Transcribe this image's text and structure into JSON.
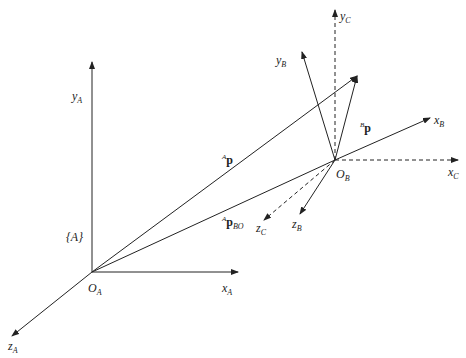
{
  "diagram": {
    "type": "coordinate-frames",
    "frames": {
      "A": {
        "origin": {
          "label": "O",
          "sub": "A"
        },
        "axes": [
          {
            "name": "x",
            "sub": "A"
          },
          {
            "name": "y",
            "sub": "A"
          },
          {
            "name": "z",
            "sub": "A"
          }
        ],
        "frame_label": "{A}"
      },
      "B": {
        "origin": {
          "label": "O",
          "sub": "B"
        },
        "axes": [
          {
            "name": "x",
            "sub": "B"
          },
          {
            "name": "y",
            "sub": "B"
          },
          {
            "name": "z",
            "sub": "B"
          }
        ]
      },
      "C": {
        "origin_shared_with": "B",
        "line_style": "dashed",
        "axes": [
          {
            "name": "x",
            "sub": "C"
          },
          {
            "name": "y",
            "sub": "C"
          },
          {
            "name": "z",
            "sub": "C"
          }
        ]
      }
    },
    "vectors": [
      {
        "sup": "A",
        "main": "p",
        "sub": ""
      },
      {
        "sup": "B",
        "main": "p",
        "sub": ""
      },
      {
        "sup": "A",
        "main": "p",
        "sub": "BO"
      }
    ],
    "colors": {
      "line": "#222222",
      "background": "#ffffff"
    }
  }
}
